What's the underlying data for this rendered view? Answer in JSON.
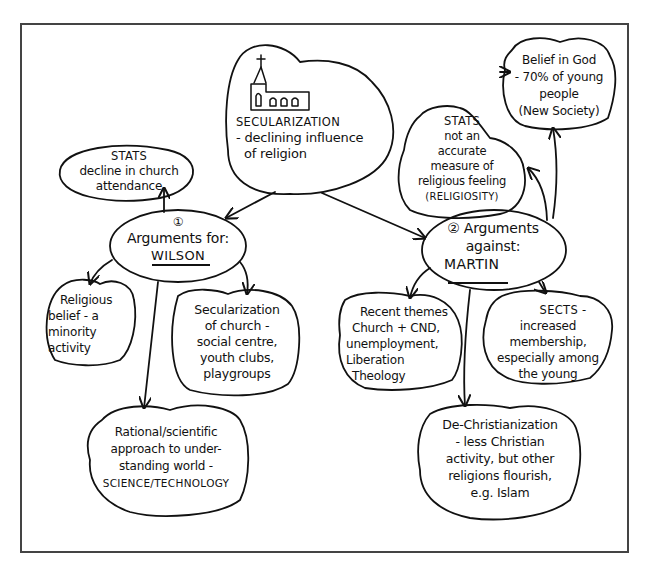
{
  "diagram": {
    "type": "mind-map",
    "central": {
      "icon": "church-icon",
      "title": "SECULARIZATION",
      "subtitle_lines": [
        "- declining influence",
        "of religion"
      ]
    },
    "for_branch": {
      "number": "①",
      "label": "Arguments for:",
      "author": "WILSON",
      "children": [
        {
          "id": "stats-attendance",
          "lines": [
            "STATS",
            "decline in church",
            "attendance"
          ]
        },
        {
          "id": "minority-activity",
          "lines": [
            "Religious",
            "belief - a",
            "minority",
            "activity"
          ]
        },
        {
          "id": "secularization-church",
          "lines": [
            "Secularization",
            "of church -",
            "social centre,",
            "youth clubs,",
            "playgroups"
          ]
        },
        {
          "id": "rational-scientific",
          "lines": [
            "Rational/scientific",
            "approach to under-",
            "standing world -",
            "SCIENCE/TECHNOLOGY"
          ]
        }
      ]
    },
    "against_branch": {
      "number": "②",
      "label": "Arguments",
      "label2": "against:",
      "author": "MARTIN",
      "children": [
        {
          "id": "belief-in-god",
          "lines": [
            "Belief in God",
            "- 70% of young",
            "people",
            "(New Society)"
          ]
        },
        {
          "id": "stats-not-accurate",
          "lines": [
            "STATS",
            "not an",
            "accurate",
            "measure of",
            "religious feeling",
            "(RELIGIOSITY)"
          ]
        },
        {
          "id": "recent-themes",
          "lines": [
            "Recent themes",
            "Church + CND,",
            "unemployment,",
            "Liberation",
            "Theology"
          ]
        },
        {
          "id": "sects",
          "lines": [
            "SECTS -",
            "increased",
            "membership,",
            "especially among",
            "the young"
          ]
        },
        {
          "id": "de-christianization",
          "lines": [
            "De-Christianization",
            "- less Christian",
            "activity, but other",
            "religions flourish,",
            "e.g. Islam"
          ]
        }
      ]
    },
    "colors": {
      "ink": "#111111",
      "frame": "#444444",
      "background": "#ffffff"
    }
  }
}
